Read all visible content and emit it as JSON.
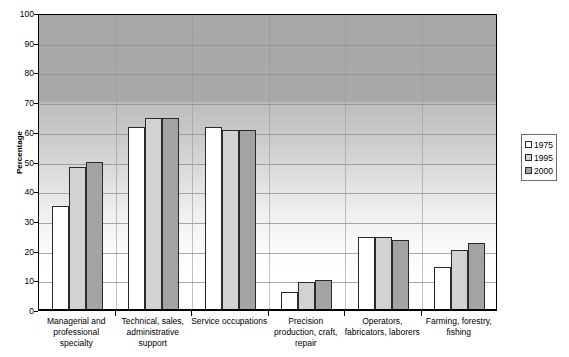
{
  "chart_data": {
    "type": "bar",
    "title": "",
    "xlabel": "",
    "ylabel": "Percentage",
    "ylim": [
      0,
      100
    ],
    "ytick_step": 10,
    "yticks": [
      0,
      10,
      20,
      30,
      40,
      50,
      60,
      70,
      80,
      90,
      100
    ],
    "grid": true,
    "legend_position": "right",
    "categories": [
      "Managerial and professional specialty",
      "Technical, sales, administrative support",
      "Service occupations",
      "Precision production, craft, repair",
      "Operators, fabricators, laborers",
      "Farming, forestry, fishing"
    ],
    "category_lines": [
      [
        "Managerial and",
        "professional",
        "specialty"
      ],
      [
        "Technical, sales,",
        "administrative",
        "support"
      ],
      [
        "Service occupations"
      ],
      [
        "Precision",
        "production, craft,",
        "repair"
      ],
      [
        "Operators,",
        "fabricators, laborers"
      ],
      [
        "Farming, forestry,",
        "fishing"
      ]
    ],
    "series": [
      {
        "name": "1975",
        "color": "#ffffff",
        "values": [
          35,
          61.5,
          61.5,
          6,
          24.5,
          14.5
        ]
      },
      {
        "name": "1995",
        "color": "#d2d2d2",
        "values": [
          48,
          64.5,
          60.5,
          9.5,
          24.5,
          20.2
        ]
      },
      {
        "name": "2000",
        "color": "#a3a3a3",
        "values": [
          50,
          64.5,
          60.5,
          10.2,
          23.5,
          22.6
        ]
      }
    ]
  },
  "legend": {
    "items": [
      {
        "label": "1975",
        "swatch": "white-swatch"
      },
      {
        "label": "1995",
        "swatch": "light-gray-swatch"
      },
      {
        "label": "2000",
        "swatch": "dark-gray-swatch"
      }
    ]
  },
  "axes": {
    "y_title": "Percentage"
  }
}
